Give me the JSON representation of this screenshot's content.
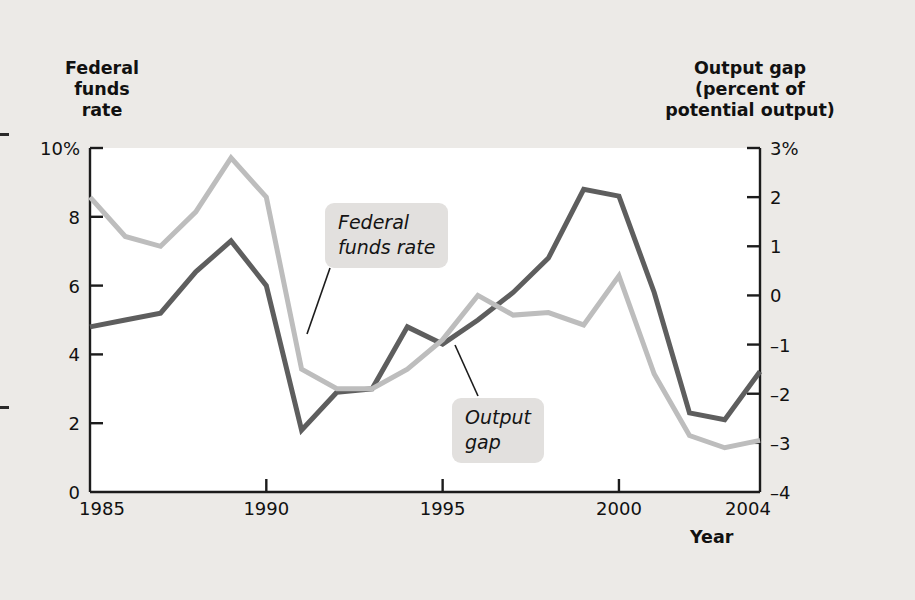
{
  "figure": {
    "background_color": "#eceae7",
    "plot_background_color": "#ffffff",
    "axis_color": "#1c1c1c",
    "left_axis_title": "Federal\nfunds\nrate",
    "right_axis_title": "Output gap\n(percent of\npotential output)",
    "x_axis_name": "Year"
  },
  "callouts": [
    {
      "id": "federal-funds-rate",
      "text": "Federal\nfunds rate"
    },
    {
      "id": "output-gap",
      "text": "Output\ngap"
    }
  ],
  "chart_data": {
    "type": "line",
    "title": "",
    "xlabel": "Year",
    "ylabel": "Federal funds rate",
    "y2label": "Output gap (percent of potential output)",
    "grid": false,
    "legend": "annotated-callouts",
    "xlim": [
      1985,
      2004
    ],
    "xticks": [
      1985,
      1990,
      1995,
      2000,
      2004
    ],
    "xtick_labels": [
      "1985",
      "1990",
      "1995",
      "2000",
      "2004"
    ],
    "ylim": [
      0,
      10
    ],
    "yticks": [
      0,
      2,
      4,
      6,
      8,
      10
    ],
    "ytick_labels": [
      "0",
      "2",
      "4",
      "6",
      "8",
      "10%"
    ],
    "y2lim": [
      -4,
      3
    ],
    "y2ticks": [
      -4,
      -3,
      -2,
      -1,
      0,
      1,
      2,
      3
    ],
    "y2tick_labels": [
      "-4",
      "-3",
      "-2",
      "-1",
      "0",
      "1",
      "2",
      "3%"
    ],
    "x": [
      1985,
      1986,
      1987,
      1988,
      1989,
      1990,
      1991,
      1992,
      1993,
      1994,
      1995,
      1996,
      1997,
      1998,
      1999,
      2000,
      2001,
      2002,
      2003,
      2004
    ],
    "series": [
      {
        "name": "Federal funds rate",
        "axis": "left",
        "color": "#5e5e5e",
        "line_width": 5,
        "values": [
          4.8,
          5.0,
          5.2,
          6.4,
          7.3,
          6.0,
          1.8,
          2.9,
          3.0,
          4.8,
          4.3,
          5.0,
          5.8,
          6.8,
          8.8,
          8.6,
          5.8,
          2.3,
          2.1,
          3.5
        ]
      },
      {
        "name": "Output gap",
        "axis": "right",
        "color": "#bdbdbd",
        "line_width": 5,
        "values": [
          2.0,
          1.2,
          1.0,
          1.7,
          2.8,
          2.0,
          -1.5,
          -1.9,
          -1.9,
          -1.5,
          -0.9,
          0.0,
          -0.4,
          -0.35,
          -0.6,
          0.4,
          -1.6,
          -2.85,
          -3.1,
          -2.95
        ]
      }
    ]
  }
}
